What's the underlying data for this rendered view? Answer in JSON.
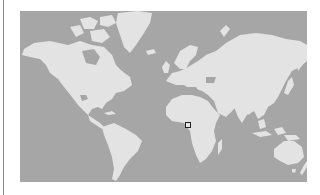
{
  "map": {
    "projection": "mercator-world",
    "colors": {
      "ocean": "#a6a6a6",
      "land": "#e3e3e3",
      "marker_border": "#222222",
      "marker_fill": "#e6e6e6",
      "page_background": "#ffffff"
    },
    "marker": {
      "icon": "square-marker-icon",
      "location_description": "Central/East Africa",
      "left_px": 185,
      "top_px": 122
    }
  }
}
